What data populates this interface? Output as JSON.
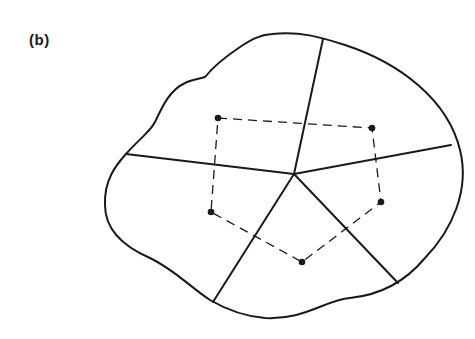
{
  "figure": {
    "panel_label": "(b)",
    "colors": {
      "stroke": "#1a1a1a",
      "background": "#ffffff"
    },
    "center_vertex": {
      "x": 294,
      "y": 174
    },
    "spokes": [
      {
        "name": "top",
        "x": 323,
        "y": 39
      },
      {
        "name": "right",
        "x": 451,
        "y": 145
      },
      {
        "name": "lower-right",
        "x": 398,
        "y": 283
      },
      {
        "name": "lower-left",
        "x": 213,
        "y": 302
      },
      {
        "name": "left",
        "x": 126,
        "y": 154
      }
    ],
    "points": [
      {
        "name": "upper-left",
        "x": 218,
        "y": 118
      },
      {
        "name": "upper-right",
        "x": 372,
        "y": 128
      },
      {
        "name": "right",
        "x": 381,
        "y": 202
      },
      {
        "name": "bottom",
        "x": 302,
        "y": 262
      },
      {
        "name": "left",
        "x": 211,
        "y": 212
      }
    ],
    "boundary_path": "M 272 34 C 300 31 320 37 345 45 C 400 63 448 100 460 150 C 470 190 452 230 425 258 C 405 282 380 295 350 298 C 325 300 305 320 265 318 C 240 316 222 307 210 300 C 190 287 175 270 150 258 C 120 245 105 228 105 205 C 104 180 116 165 126 154 C 140 138 150 132 155 122 C 163 105 170 90 185 83 C 193 79 200 79 205 77 C 213 67 225 57 240 47 C 252 39 260 35 272 34 Z"
  }
}
